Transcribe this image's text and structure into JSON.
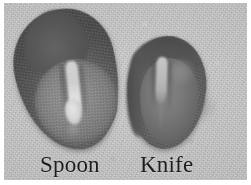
{
  "figure": {
    "kind": "grayscale-photograph",
    "background_color": "#c2c2c2",
    "border_color": "#ffffff"
  },
  "specimens": [
    {
      "id": "spoon",
      "label": "Spoon",
      "shape": "elongated oval with pointed upper lobe",
      "body_color": "#5e5e5e",
      "inner_color": "#8b8b8b",
      "highlight_color": "#dddddd"
    },
    {
      "id": "knife",
      "label": "Knife",
      "shape": "rounded oval with dark upper rim",
      "body_color": "#686868",
      "inner_color": "#7a7a7a",
      "highlight_color": "#c3c3c3"
    }
  ],
  "labels": {
    "left": "Spoon",
    "right": "Knife"
  }
}
